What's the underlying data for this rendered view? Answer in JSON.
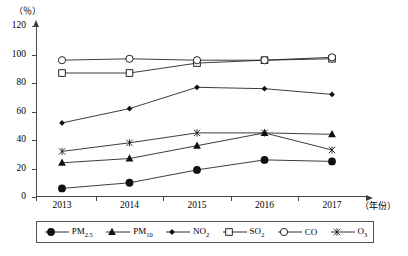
{
  "chart_data": {
    "type": "line",
    "title": "",
    "subtitle": "",
    "unit_label": "（％）",
    "xlabel": "（年份）",
    "ylabel": "",
    "categories": [
      "2013",
      "2014",
      "2015",
      "2016",
      "2017"
    ],
    "x": [
      2013,
      2014,
      2015,
      2016,
      2017
    ],
    "ylim": [
      0,
      120
    ],
    "yticks": [
      0,
      20,
      40,
      60,
      80,
      100,
      120
    ],
    "grid": false,
    "legend_position": "bottom",
    "series": [
      {
        "name": "PM2.5",
        "label": "PM",
        "sub": "2.5",
        "marker": "filled-circle",
        "values": [
          6,
          10,
          19,
          26,
          25
        ]
      },
      {
        "name": "PM10",
        "label": "PM",
        "sub": "10",
        "marker": "filled-triangle",
        "values": [
          24,
          27,
          36,
          45,
          44
        ]
      },
      {
        "name": "NO2",
        "label": "NO",
        "sub": "2",
        "marker": "filled-diamond",
        "values": [
          52,
          62,
          77,
          76,
          72
        ]
      },
      {
        "name": "SO2",
        "label": "SO",
        "sub": "2",
        "marker": "open-square",
        "values": [
          87,
          87,
          94,
          96,
          97
        ]
      },
      {
        "name": "CO",
        "label": "CO",
        "sub": "",
        "marker": "open-circle",
        "values": [
          96,
          97,
          96,
          96,
          98
        ]
      },
      {
        "name": "O3",
        "label": "O",
        "sub": "3",
        "marker": "cross",
        "values": [
          32,
          38,
          45,
          45,
          33
        ]
      }
    ]
  }
}
